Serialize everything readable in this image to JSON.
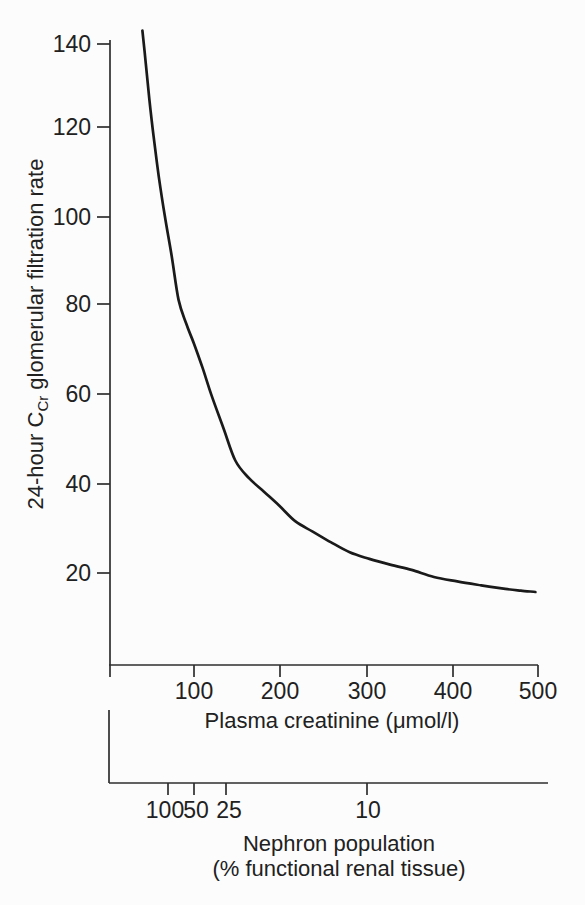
{
  "figure": {
    "background": "#fcfcfc",
    "ink_color": "#212121",
    "curve_color": "#1a1a1a"
  },
  "chart_data": {
    "type": "line",
    "title": "",
    "x_axis": {
      "label": "Plasma creatinine (μmol/l)",
      "ticks": [
        "100",
        "200",
        "300",
        "400",
        "500"
      ],
      "range": [
        0,
        500
      ],
      "grid": false
    },
    "y_axis": {
      "label_prefix": "24-hour C",
      "label_subscript": "Cr",
      "label_suffix": " glomerular filtration rate",
      "ticks": [
        "140",
        "120",
        "100",
        "80",
        "60",
        "40",
        "20"
      ],
      "range": [
        0,
        148
      ],
      "grid": false
    },
    "secondary_x_axis": {
      "label_line1": "Nephron population",
      "label_line2": "(% functional renal tissue)",
      "ticks": [
        "100",
        "50",
        "25",
        "10"
      ],
      "tick_positions_creatinine_equiv": [
        70,
        100,
        137,
        301
      ]
    },
    "legend": null,
    "series": [
      {
        "name": "24-hour creatinine clearance GFR vs plasma creatinine",
        "points": [
          [
            40,
            142.5
          ],
          [
            44,
            135
          ],
          [
            48,
            127
          ],
          [
            53,
            118.5
          ],
          [
            59,
            109.5
          ],
          [
            66,
            100.5
          ],
          [
            74,
            91.5
          ],
          [
            82,
            81.5
          ],
          [
            91,
            76
          ],
          [
            100,
            71.5
          ],
          [
            110,
            66
          ],
          [
            120,
            60
          ],
          [
            134,
            52.5
          ],
          [
            148,
            45
          ],
          [
            164,
            41
          ],
          [
            181,
            38
          ],
          [
            199,
            34.8
          ],
          [
            218,
            31.2
          ],
          [
            238,
            28.9
          ],
          [
            259,
            26.5
          ],
          [
            281,
            24.2
          ],
          [
            304,
            22.7
          ],
          [
            328,
            21.4
          ],
          [
            353,
            20.2
          ],
          [
            379,
            18.6
          ],
          [
            406,
            17.6
          ],
          [
            434,
            16.7
          ],
          [
            462,
            15.9
          ],
          [
            480,
            15.5
          ],
          [
            497,
            15.2
          ]
        ]
      }
    ]
  }
}
